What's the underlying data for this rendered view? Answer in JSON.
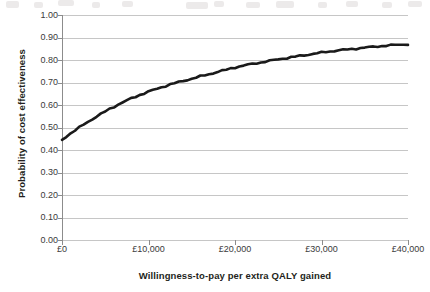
{
  "chart_data": {
    "type": "line",
    "title": "",
    "subtitle": "",
    "xlabel": "Willingness-to-pay per extra QALY gained",
    "ylabel": "Probability of cost effectiveness",
    "xlim": [
      0,
      40000
    ],
    "ylim": [
      0,
      1.0
    ],
    "grid": "horizontal",
    "legend": "none",
    "x_tick_labels": [
      "£0",
      "£10,000",
      "£20,000",
      "£30,000",
      "£40,000"
    ],
    "x_tick_values": [
      0,
      10000,
      20000,
      30000,
      40000
    ],
    "y_tick_labels": [
      "0.00",
      "0.10",
      "0.20",
      "0.30",
      "0.40",
      "0.50",
      "0.60",
      "0.70",
      "0.80",
      "0.90",
      "1.00"
    ],
    "y_tick_values": [
      0.0,
      0.1,
      0.2,
      0.3,
      0.4,
      0.5,
      0.6,
      0.7,
      0.8,
      0.9,
      1.0
    ],
    "series": [
      {
        "name": "Probability of cost effectiveness",
        "color": "#1a1a1a",
        "line_width": 2.6,
        "x": [
          0,
          500,
          1000,
          1500,
          2000,
          2500,
          3000,
          3500,
          4000,
          4500,
          5000,
          5500,
          6000,
          6500,
          7000,
          7500,
          8000,
          8500,
          9000,
          9500,
          10000,
          10500,
          11000,
          11500,
          12000,
          12500,
          13000,
          13500,
          14000,
          14500,
          15000,
          15500,
          16000,
          16500,
          17000,
          17500,
          18000,
          18500,
          19000,
          19500,
          20000,
          20500,
          21000,
          21500,
          22000,
          22500,
          23000,
          23500,
          24000,
          24500,
          25000,
          25500,
          26000,
          26500,
          27000,
          27500,
          28000,
          28500,
          29000,
          29500,
          30000,
          30500,
          31000,
          31500,
          32000,
          32500,
          33000,
          33500,
          34000,
          34500,
          35000,
          35500,
          36000,
          36500,
          37000,
          37500,
          38000,
          38500,
          39000,
          39500,
          40000
        ],
        "y": [
          0.445,
          0.46,
          0.474,
          0.487,
          0.5,
          0.513,
          0.525,
          0.537,
          0.549,
          0.56,
          0.571,
          0.582,
          0.592,
          0.602,
          0.611,
          0.62,
          0.629,
          0.637,
          0.645,
          0.652,
          0.659,
          0.666,
          0.672,
          0.679,
          0.685,
          0.691,
          0.697,
          0.702,
          0.707,
          0.712,
          0.717,
          0.722,
          0.727,
          0.732,
          0.737,
          0.742,
          0.747,
          0.752,
          0.757,
          0.762,
          0.767,
          0.771,
          0.775,
          0.779,
          0.782,
          0.786,
          0.789,
          0.793,
          0.796,
          0.8,
          0.803,
          0.806,
          0.809,
          0.812,
          0.815,
          0.818,
          0.821,
          0.824,
          0.827,
          0.83,
          0.833,
          0.836,
          0.838,
          0.841,
          0.843,
          0.845,
          0.847,
          0.849,
          0.851,
          0.853,
          0.855,
          0.857,
          0.859,
          0.861,
          0.862,
          0.864,
          0.865,
          0.867,
          0.868,
          0.869,
          0.87
        ]
      }
    ],
    "annotated_values": {
      "start_probability": 0.445,
      "at_10000": 0.659,
      "at_20000": 0.767,
      "at_30000": 0.833,
      "at_40000": 0.87
    }
  },
  "axes": {
    "y_title": "Probability of cost effectiveness",
    "x_title": "Willingness-to-pay per extra QALY gained"
  },
  "colors": {
    "line": "#1a1a1a",
    "gridline": "#b8b8b8",
    "axis": "#8c8c8c",
    "tick_text": "#3a3a3a",
    "title_text": "#231f20",
    "background": "#ffffff"
  }
}
